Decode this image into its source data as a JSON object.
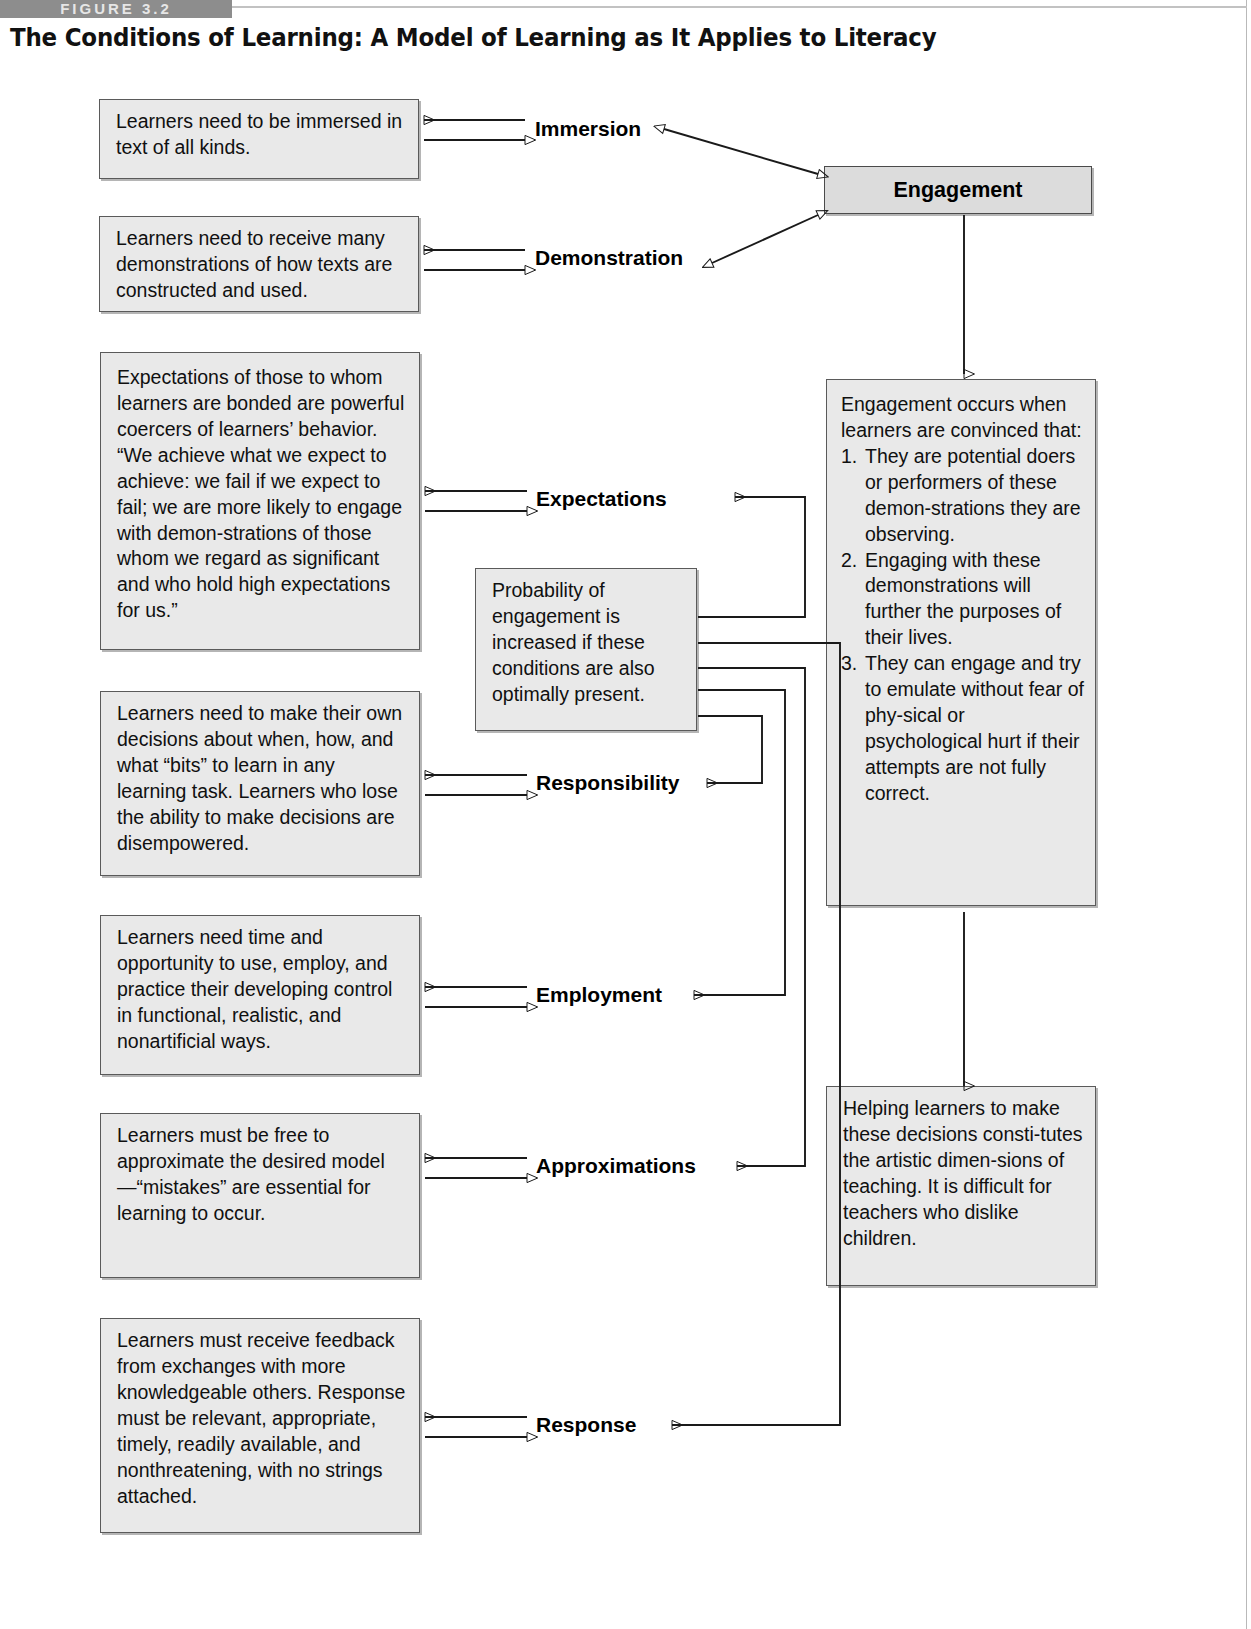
{
  "figure": {
    "tab_label": "FIGURE 3.2",
    "title": "The Conditions of Learning: A Model of Learning as It Applies to Literacy"
  },
  "conditions": [
    {
      "label": "Immersion",
      "description": "Learners need to be immersed in text of all kinds."
    },
    {
      "label": "Demonstration",
      "description": "Learners need to receive many demonstrations of how texts are constructed and used."
    },
    {
      "label": "Expectations",
      "description": "Expectations of those to whom learners are bonded are powerful coercers of learners’ behavior. “We achieve what we expect to achieve: we fail if we expect to fail; we are more likely to engage with demon-strations of those whom we regard as significant and who hold high expectations for us.”"
    },
    {
      "label": "Responsibility",
      "description": "Learners need to make their own decisions about when, how, and what “bits” to learn in any learning task. Learners who lose the ability to make decisions are disempowered."
    },
    {
      "label": "Employment",
      "description": "Learners need time and opportunity to use, employ, and practice their developing control in functional, realistic, and nonartificial ways."
    },
    {
      "label": "Approximations",
      "description": "Learners must be free to approximate the desired model—“mistakes” are essential for learning to occur."
    },
    {
      "label": "Response",
      "description": "Learners must receive feedback from exchanges with more knowledgeable others. Response must be relevant, appropriate, timely, readily available, and nonthreatening, with no strings attached."
    }
  ],
  "engagement": {
    "title": "Engagement",
    "detail_intro": "Engagement occurs when learners are convinced that:",
    "detail_items": [
      {
        "number": "1.",
        "text": "They are potential doers or performers of these demon-strations they are observing."
      },
      {
        "number": "2.",
        "text": "Engaging with these demonstrations will further the purposes of their lives."
      },
      {
        "number": "3.",
        "text": "They can engage and try to emulate without fear of phy-sical or psychological hurt if their attempts are not fully correct."
      }
    ]
  },
  "probability": {
    "text": "Probability of engagement is increased if these conditions are also optimally present."
  },
  "teaching": {
    "text": "Helping learners to make these decisions consti-tutes the artistic dimen-sions of teaching. It is difficult for teachers who dislike children."
  },
  "colors": {
    "box_fill": "#e9e9e9",
    "engagement_fill": "#dcdcdc",
    "border": "#5a5a5a",
    "tab": "#8d8d8d",
    "text": "#101010"
  }
}
